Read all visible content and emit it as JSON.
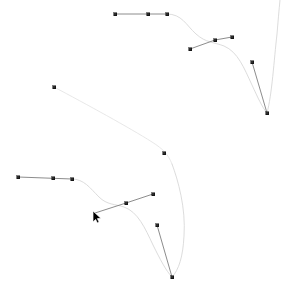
{
  "app": {
    "surface": "vector-editor-canvas",
    "background_color": "#ffffff"
  },
  "colors": {
    "path_stroke": "#d8d8d8",
    "path_stroke_alt": "#e2e2e2",
    "handle_line": "#6f6f6f",
    "node_fill": "#2b2b2b",
    "node_stroke": "#000000",
    "cursor_fill": "#000000",
    "cursor_stroke": "#ffffff"
  },
  "chart_data": {
    "type": "scatter",
    "title": "",
    "subtitle": "",
    "xlabel": "",
    "ylabel": "",
    "xlim": [
      0,
      289
    ],
    "ylim": [
      0,
      298
    ],
    "grid": false,
    "legend": null,
    "annotations": [],
    "tick_labels": {
      "x": [],
      "y": []
    }
  },
  "geometry": {
    "stroke_widths": {
      "path": 0.9,
      "path_thin": 0.7,
      "handle": 0.8
    },
    "node_size": 3,
    "paths": [
      {
        "id": "curve-upper-main",
        "name": "upper-bezier-curve",
        "d": "M 167 14 C 182 14 186 25 196 34 C 206 43 214 42 224 46 C 238 52 244 68 252 85 C 258 98 262 107 267 113",
        "stroke": "#d8d8d8",
        "width": 0.9
      },
      {
        "id": "curve-upper-right-tail",
        "name": "upper-right-tail-curve",
        "d": "M 267 113 C 272 95 274 60 277 34 C 278 22 279 10 280 0",
        "stroke": "#d8d8d8",
        "width": 0.9
      },
      {
        "id": "curve-long-diagonal",
        "name": "long-diagonal-curve",
        "d": "M 54 87 C 86 104 130 128 152 142 C 163 149 168 154 172 164",
        "stroke": "#e2e2e2",
        "width": 0.8
      },
      {
        "id": "curve-lower-sweep",
        "name": "lower-right-sweep-curve",
        "d": "M 172 164 C 178 180 186 208 184 236 C 183 256 179 270 172 277",
        "stroke": "#d8d8d8",
        "width": 0.9
      },
      {
        "id": "curve-lower-left-bend",
        "name": "lower-left-bend-curve",
        "d": "M 72 179 C 84 179 90 188 99 197 C 107 205 115 204 124 207 C 138 212 145 228 153 245 C 160 259 166 271 172 277",
        "stroke": "#d8d8d8",
        "width": 0.9
      }
    ],
    "handles": [
      {
        "id": "handle-top-left",
        "name": "handle-top-left-segment",
        "x1": 115,
        "y1": 14,
        "x2": 167,
        "y2": 14,
        "stroke": "#6f6f6f",
        "width": 0.8
      },
      {
        "id": "handle-upper-cluster-left",
        "name": "handle-upper-cluster-left-segment",
        "x1": 190,
        "y1": 49,
        "x2": 215,
        "y2": 40,
        "stroke": "#6f6f6f",
        "width": 0.8
      },
      {
        "id": "handle-upper-cluster-right",
        "name": "handle-upper-cluster-right-segment",
        "x1": 215,
        "y1": 40,
        "x2": 232,
        "y2": 37,
        "stroke": "#6f6f6f",
        "width": 0.8
      },
      {
        "id": "handle-right-descend",
        "name": "handle-right-descending-segment",
        "x1": 252,
        "y1": 62,
        "x2": 267,
        "y2": 113,
        "stroke": "#6f6f6f",
        "width": 0.8
      },
      {
        "id": "handle-lower-left",
        "name": "handle-lower-left-segment",
        "x1": 18,
        "y1": 177,
        "x2": 72,
        "y2": 179,
        "stroke": "#6f6f6f",
        "width": 0.8
      },
      {
        "id": "handle-lower-cluster-left",
        "name": "handle-lower-cluster-left-segment",
        "x1": 95,
        "y1": 213,
        "x2": 126,
        "y2": 203,
        "stroke": "#6f6f6f",
        "width": 0.8
      },
      {
        "id": "handle-lower-cluster-right",
        "name": "handle-lower-cluster-right-segment",
        "x1": 126,
        "y1": 203,
        "x2": 153,
        "y2": 194,
        "stroke": "#6f6f6f",
        "width": 0.8
      },
      {
        "id": "handle-bottom-descend",
        "name": "handle-bottom-descending-segment",
        "x1": 157,
        "y1": 225,
        "x2": 172,
        "y2": 277,
        "stroke": "#6f6f6f",
        "width": 0.8
      }
    ],
    "nodes": [
      {
        "id": "node-01",
        "name": "anchor-top-left-start",
        "x": 115,
        "y": 14
      },
      {
        "id": "node-02",
        "name": "anchor-top-mid",
        "x": 148,
        "y": 14
      },
      {
        "id": "node-03",
        "name": "anchor-top-right-end",
        "x": 167,
        "y": 14
      },
      {
        "id": "node-04",
        "name": "anchor-upper-handle-tip",
        "x": 190,
        "y": 49
      },
      {
        "id": "node-05",
        "name": "anchor-upper-cluster",
        "x": 215,
        "y": 40
      },
      {
        "id": "node-06",
        "name": "anchor-upper-cluster-tip",
        "x": 232,
        "y": 37
      },
      {
        "id": "node-07",
        "name": "anchor-right-upper",
        "x": 252,
        "y": 62
      },
      {
        "id": "node-08",
        "name": "anchor-right-lower",
        "x": 267,
        "y": 113
      },
      {
        "id": "node-09",
        "name": "anchor-diagonal-start",
        "x": 54,
        "y": 87
      },
      {
        "id": "node-10",
        "name": "anchor-diagonal-mid",
        "x": 164,
        "y": 153
      },
      {
        "id": "node-11",
        "name": "anchor-lower-left-start",
        "x": 18,
        "y": 177
      },
      {
        "id": "node-12",
        "name": "anchor-lower-left-mid",
        "x": 53,
        "y": 178
      },
      {
        "id": "node-13",
        "name": "anchor-lower-left-end",
        "x": 72,
        "y": 179
      },
      {
        "id": "node-14",
        "name": "anchor-lower-cluster",
        "x": 126,
        "y": 203
      },
      {
        "id": "node-15",
        "name": "anchor-lower-cluster-tip",
        "x": 153,
        "y": 194
      },
      {
        "id": "node-16",
        "name": "anchor-bottom-handle-top",
        "x": 157,
        "y": 225
      },
      {
        "id": "node-17",
        "name": "anchor-bottom-end",
        "x": 172,
        "y": 277
      }
    ]
  },
  "cursor": {
    "name": "mouse-pointer",
    "x": 93,
    "y": 211,
    "kind": "arrow"
  }
}
